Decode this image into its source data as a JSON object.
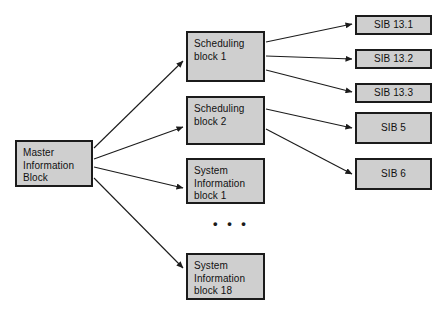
{
  "diagram": {
    "background_color": "#ffffff",
    "node_fill_color": "#cfcfcf",
    "node_border_color": "#1b1b1b",
    "edge_color": "#1b1b1b",
    "ellipsis": "• • •",
    "nodes": [
      {
        "id": "mib",
        "label": "Master\nInformation\nBlock",
        "x": 15,
        "y": 140,
        "w": 78,
        "h": 47,
        "align": "left"
      },
      {
        "id": "sched1",
        "label": "Scheduling\nblock 1",
        "x": 186,
        "y": 31,
        "w": 79,
        "h": 51,
        "align": "left"
      },
      {
        "id": "sched2",
        "label": "Scheduling\nblock 2",
        "x": 186,
        "y": 96,
        "w": 79,
        "h": 49,
        "align": "left"
      },
      {
        "id": "sib1",
        "label": "System\nInformation\nblock 1",
        "x": 186,
        "y": 158,
        "w": 79,
        "h": 46,
        "align": "left"
      },
      {
        "id": "sib18",
        "label": "System\nInformation\nblock 18",
        "x": 186,
        "y": 253,
        "w": 79,
        "h": 47,
        "align": "left"
      },
      {
        "id": "sib131",
        "label": "SIB 13.1",
        "x": 355,
        "y": 15,
        "w": 77,
        "h": 20,
        "align": "center"
      },
      {
        "id": "sib132",
        "label": "SIB 13.2",
        "x": 355,
        "y": 49,
        "w": 77,
        "h": 20,
        "align": "center"
      },
      {
        "id": "sib133",
        "label": "SIB 13.3",
        "x": 355,
        "y": 83,
        "w": 77,
        "h": 20,
        "align": "center"
      },
      {
        "id": "sib5",
        "label": "SIB 5",
        "x": 355,
        "y": 112,
        "w": 77,
        "h": 32,
        "align": "center"
      },
      {
        "id": "sib6",
        "label": "SIB 6",
        "x": 355,
        "y": 158,
        "w": 77,
        "h": 32,
        "align": "center"
      }
    ],
    "edges": [
      {
        "id": "mib-to-sched1",
        "from": "mib",
        "to": "sched1",
        "x1": 94,
        "y1": 148,
        "x2": 183,
        "y2": 61
      },
      {
        "id": "mib-to-sched2",
        "from": "mib",
        "to": "sched2",
        "x1": 94,
        "y1": 159,
        "x2": 183,
        "y2": 127
      },
      {
        "id": "mib-to-sib1",
        "from": "mib",
        "to": "sib1",
        "x1": 94,
        "y1": 167,
        "x2": 183,
        "y2": 188
      },
      {
        "id": "mib-to-sib18",
        "from": "mib",
        "to": "sib18",
        "x1": 94,
        "y1": 178,
        "x2": 183,
        "y2": 268
      },
      {
        "id": "sched1-to-sib131",
        "from": "sched1",
        "to": "sib131",
        "x1": 266,
        "y1": 42,
        "x2": 352,
        "y2": 24
      },
      {
        "id": "sched1-to-sib132",
        "from": "sched1",
        "to": "sib132",
        "x1": 266,
        "y1": 56,
        "x2": 352,
        "y2": 59
      },
      {
        "id": "sched1-to-sib133",
        "from": "sched1",
        "to": "sib133",
        "x1": 266,
        "y1": 70,
        "x2": 352,
        "y2": 92
      },
      {
        "id": "sched2-to-sib5",
        "from": "sched2",
        "to": "sib5",
        "x1": 266,
        "y1": 109,
        "x2": 352,
        "y2": 128
      },
      {
        "id": "sched2-to-sib6",
        "from": "sched2",
        "to": "sib6",
        "x1": 266,
        "y1": 129,
        "x2": 352,
        "y2": 174
      }
    ],
    "ellipsis_pos": {
      "x": 213,
      "y": 217
    }
  }
}
